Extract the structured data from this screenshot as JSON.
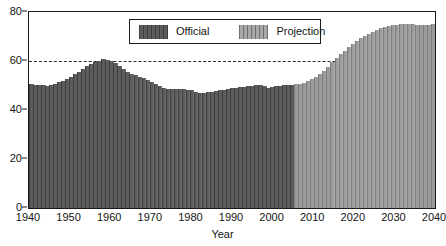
{
  "chart_data": {
    "type": "bar",
    "title": "",
    "subtitle": "",
    "xlabel": "Year",
    "ylabel": "",
    "xlim": [
      1940,
      2040
    ],
    "ylim": [
      0,
      80
    ],
    "grid": true,
    "gridlines_y": [
      20,
      40,
      60
    ],
    "yticks": [
      0,
      20,
      40,
      60,
      80
    ],
    "xticks": [
      1940,
      1950,
      1960,
      1970,
      1980,
      1990,
      2000,
      2010,
      2020,
      2030,
      2040
    ],
    "legend_position": "top-center",
    "legend": [
      {
        "name": "Official",
        "color": "#5c5c5c"
      },
      {
        "name": "Projection",
        "color": "#9c9c9c"
      }
    ],
    "split_year": 2006,
    "x": [
      1940,
      1941,
      1942,
      1943,
      1944,
      1945,
      1946,
      1947,
      1948,
      1949,
      1950,
      1951,
      1952,
      1953,
      1954,
      1955,
      1956,
      1957,
      1958,
      1959,
      1960,
      1961,
      1962,
      1963,
      1964,
      1965,
      1966,
      1967,
      1968,
      1969,
      1970,
      1971,
      1972,
      1973,
      1974,
      1975,
      1976,
      1977,
      1978,
      1979,
      1980,
      1981,
      1982,
      1983,
      1984,
      1985,
      1986,
      1987,
      1988,
      1989,
      1990,
      1991,
      1992,
      1993,
      1994,
      1995,
      1996,
      1997,
      1998,
      1999,
      2000,
      2001,
      2002,
      2003,
      2004,
      2005,
      2006,
      2007,
      2008,
      2009,
      2010,
      2011,
      2012,
      2013,
      2014,
      2015,
      2016,
      2017,
      2018,
      2019,
      2020,
      2021,
      2022,
      2023,
      2024,
      2025,
      2026,
      2027,
      2028,
      2029,
      2030,
      2031,
      2032,
      2033,
      2034,
      2035,
      2036,
      2037,
      2038,
      2039,
      2040
    ],
    "series": [
      {
        "name": "Official",
        "color": "#5c5c5c",
        "values": [
          50.5,
          50.4,
          50.3,
          50.2,
          50.0,
          50.2,
          50.6,
          51.3,
          52.0,
          52.8,
          53.6,
          54.5,
          55.6,
          56.8,
          57.8,
          58.6,
          59.4,
          60.2,
          61.0,
          60.6,
          60.0,
          59.0,
          57.8,
          56.6,
          55.6,
          54.8,
          54.2,
          53.6,
          53.0,
          52.4,
          51.6,
          50.6,
          49.6,
          48.8,
          48.6,
          48.6,
          48.6,
          48.6,
          48.5,
          48.3,
          48.0,
          47.5,
          47.0,
          47.0,
          47.2,
          47.5,
          47.8,
          48.0,
          48.3,
          48.6,
          48.8,
          49.0,
          49.2,
          49.4,
          49.7,
          50.0,
          50.3,
          50.2,
          49.6,
          49.1,
          49.4,
          49.8,
          50.0,
          50.1,
          50.2,
          50.4,
          50.5,
          null,
          null,
          null,
          null,
          null,
          null,
          null,
          null,
          null,
          null,
          null,
          null,
          null,
          null,
          null,
          null,
          null,
          null,
          null,
          null,
          null,
          null,
          null,
          null,
          null,
          null,
          null,
          null,
          null,
          null,
          null,
          null,
          null,
          null
        ]
      },
      {
        "name": "Projection",
        "color": "#9c9c9c",
        "values": [
          null,
          null,
          null,
          null,
          null,
          null,
          null,
          null,
          null,
          null,
          null,
          null,
          null,
          null,
          null,
          null,
          null,
          null,
          null,
          null,
          null,
          null,
          null,
          null,
          null,
          null,
          null,
          null,
          null,
          null,
          null,
          null,
          null,
          null,
          null,
          null,
          null,
          null,
          null,
          null,
          null,
          null,
          null,
          null,
          null,
          null,
          null,
          null,
          null,
          null,
          null,
          null,
          null,
          null,
          null,
          null,
          null,
          null,
          null,
          null,
          null,
          null,
          null,
          null,
          null,
          null,
          50.5,
          50.8,
          51.2,
          51.8,
          52.5,
          53.4,
          54.6,
          56.0,
          57.6,
          59.4,
          61.2,
          62.8,
          64.2,
          65.6,
          67.0,
          68.2,
          69.3,
          70.3,
          71.2,
          72.0,
          72.7,
          73.3,
          73.8,
          74.2,
          74.5,
          74.8,
          75.0,
          75.1,
          75.1,
          75.0,
          74.9,
          74.8,
          74.8,
          74.9,
          75.2
        ]
      }
    ]
  }
}
